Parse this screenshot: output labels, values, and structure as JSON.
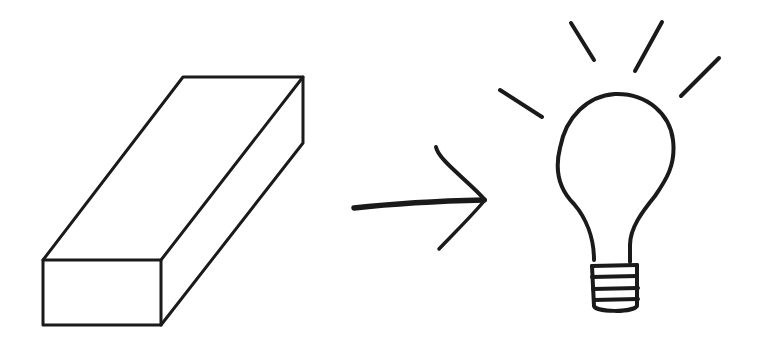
{
  "diagram": {
    "description": "Hand-drawn sketch: a rectangular block (eraser/brick) pointing via an arrow to a glowing light bulb",
    "elements": [
      {
        "id": "block",
        "label": "rectangular block"
      },
      {
        "id": "arrow",
        "label": "arrow pointing right"
      },
      {
        "id": "bulb",
        "label": "light bulb with rays"
      }
    ],
    "colors": {
      "ink": "#1a1a1a",
      "background": "#ffffff"
    }
  }
}
